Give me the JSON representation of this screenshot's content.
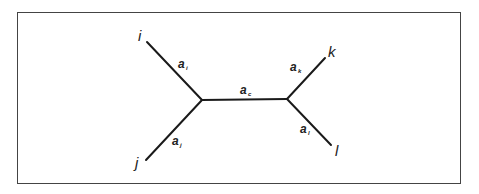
{
  "diagram": {
    "type": "unrooted-tree",
    "leaves": [
      {
        "id": "i",
        "label": "i"
      },
      {
        "id": "j",
        "label": "j"
      },
      {
        "id": "k",
        "label": "k"
      },
      {
        "id": "l",
        "label": "l"
      }
    ],
    "branches": [
      {
        "id": "ai",
        "base": "a",
        "sub": "i",
        "connects": [
          "i",
          "left-internal"
        ]
      },
      {
        "id": "aj",
        "base": "a",
        "sub": "j",
        "connects": [
          "j",
          "left-internal"
        ]
      },
      {
        "id": "ac",
        "base": "a",
        "sub": "c",
        "connects": [
          "left-internal",
          "right-internal"
        ]
      },
      {
        "id": "ak",
        "base": "a",
        "sub": "k",
        "connects": [
          "k",
          "right-internal"
        ]
      },
      {
        "id": "al",
        "base": "a",
        "sub": "l",
        "connects": [
          "l",
          "right-internal"
        ]
      }
    ],
    "colors": {
      "stroke": "#1a1a1a",
      "frame": "#444444",
      "background": "#ffffff"
    }
  }
}
